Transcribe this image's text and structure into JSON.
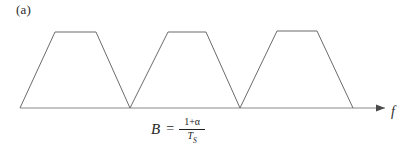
{
  "figure": {
    "panel_label": "(a)",
    "axis_label": "f",
    "formula": {
      "lhs": "B",
      "equals": "=",
      "numerator": "1+α",
      "denominator_base": "T",
      "denominator_sub": "S"
    },
    "colors": {
      "background": "#ffffff",
      "curve": "#6b6b6b",
      "axis": "#8a8a8a",
      "text": "#1f1f1f"
    }
  },
  "chart_data": {
    "type": "line",
    "title": "",
    "subtitle": "",
    "xlabel": "f",
    "ylabel": "",
    "grid": false,
    "legend": "none",
    "annotations": [
      {
        "text": "(a)",
        "x": 16,
        "y": 8,
        "role": "panel-label"
      },
      {
        "text": "B = (1+α)/T_S",
        "x": 200,
        "y": 130,
        "role": "bandwidth-formula"
      }
    ],
    "axis": {
      "baseline_y": 108,
      "x_start": 20,
      "x_end": 385,
      "arrow": "right",
      "ticks": [],
      "ticklabels": []
    },
    "series": [
      {
        "name": "trapezoid-1",
        "points": [
          {
            "x": 20,
            "y": 108
          },
          {
            "x": 55,
            "y": 32
          },
          {
            "x": 96,
            "y": 32
          },
          {
            "x": 130,
            "y": 108
          }
        ]
      },
      {
        "name": "trapezoid-2",
        "points": [
          {
            "x": 130,
            "y": 108
          },
          {
            "x": 168,
            "y": 32
          },
          {
            "x": 206,
            "y": 32
          },
          {
            "x": 240,
            "y": 108
          }
        ]
      },
      {
        "name": "trapezoid-3",
        "points": [
          {
            "x": 240,
            "y": 108
          },
          {
            "x": 277,
            "y": 31
          },
          {
            "x": 317,
            "y": 31
          },
          {
            "x": 353,
            "y": 108
          }
        ]
      }
    ]
  }
}
